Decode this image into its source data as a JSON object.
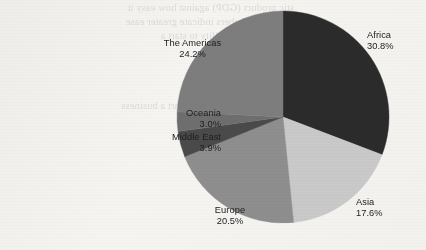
{
  "chart_data": {
    "type": "pie",
    "title": "",
    "subtitle": "",
    "xlabel": "",
    "ylabel": "",
    "legend_position": "none",
    "labels_shown": "name-and-percent",
    "grid": false,
    "categories": [
      "Africa",
      "Asia",
      "Europe",
      "Middle East",
      "Oceania",
      "The Americas"
    ],
    "values": [
      30.8,
      17.6,
      20.5,
      3.9,
      3.0,
      24.2
    ],
    "unit": "%",
    "start_angle_deg": 0,
    "direction": "clockwise",
    "slices": [
      {
        "name": "Africa",
        "value": 30.8,
        "value_label": "30.8%",
        "color": "#2b2b2b"
      },
      {
        "name": "Asia",
        "value": 17.6,
        "value_label": "17.6%",
        "color": "#c9c9c9"
      },
      {
        "name": "Europe",
        "value": 20.5,
        "value_label": "20.5%",
        "color": "#8e8e8e"
      },
      {
        "name": "Middle East",
        "value": 3.9,
        "value_label": "3.9%",
        "color": "#4a4a4a"
      },
      {
        "name": "Oceania",
        "value": 3.0,
        "value_label": "3.0%",
        "color": "#6e6e6e"
      },
      {
        "name": "The Americas",
        "value": 24.2,
        "value_label": "24.2%",
        "color": "#7d7d7d"
      }
    ]
  },
  "labels": {
    "africa": {
      "name": "Africa",
      "value": "30.8%"
    },
    "asia": {
      "name": "Asia",
      "value": "17.6%"
    },
    "europe": {
      "name": "Europe",
      "value": "20.5%"
    },
    "middle_east": {
      "name": "Middle East",
      "value": "3.9%"
    },
    "oceania": {
      "name": "Oceania",
      "value": "3.0%"
    },
    "americas": {
      "name": "The Americas",
      "value": "24.2%"
    }
  },
  "background_showthrough": {
    "line1": "stic product (GDP) against how easy it",
    "line2": "s, lower numbers indicate greater ease",
    "line3": "ng equal, the ability to start a",
    "line4": "ws this relationship.",
    "line5": "ies where it is harder to start a business",
    "line6": "Country"
  },
  "colors": {
    "paper": "#f4f2ef",
    "text": "#1d1d1d",
    "africa": "#2b2b2b",
    "asia": "#c9c9c9",
    "europe": "#8e8e8e",
    "middle_east": "#4a4a4a",
    "oceania": "#6e6e6e",
    "americas": "#7d7d7d"
  }
}
